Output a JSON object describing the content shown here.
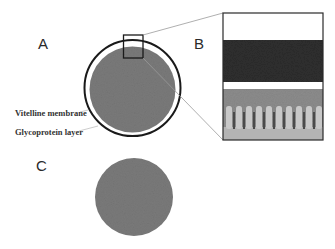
{
  "figure": {
    "panels": {
      "a": {
        "label": "A"
      },
      "b": {
        "label": "B"
      },
      "c": {
        "label": "C"
      }
    },
    "annotations": {
      "vitelline": "Vitelline membrane",
      "glycoprotein": "Glycoprotein layer"
    },
    "colors": {
      "cell_fill": "#7a7a7a",
      "ring_stroke": "#1a1a1a",
      "dark_band": "#2e2e2e",
      "pillar_bg": "#8c8c8c",
      "pillar": "#c8c8c8",
      "connector": "#9a9a9a"
    }
  }
}
